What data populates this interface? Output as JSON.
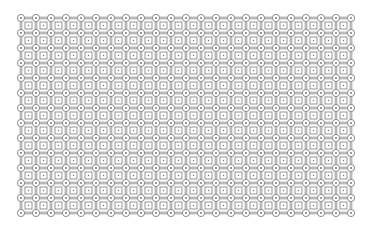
{
  "diagram": {
    "type": "lattice-grid",
    "grid": {
      "columns": 23,
      "rows": 14,
      "origin_x": 21,
      "origin_y": 18,
      "pitch_x": 15,
      "pitch_y": 15
    },
    "node": {
      "shape": "circle",
      "radius": 3.6,
      "inner_dot_radius": 0.9
    },
    "cell": {
      "shape": "square",
      "size": 7,
      "inner_dot_radius": 0.7
    },
    "colors": {
      "background": "#ffffff",
      "stroke": "#6e6e6e",
      "square_stroke": "#7a7a7a",
      "dot": "#6e6e6e"
    }
  }
}
